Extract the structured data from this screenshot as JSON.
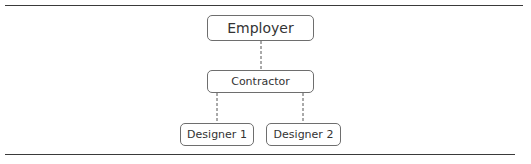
{
  "diagram": {
    "type": "org-chart",
    "nodes": [
      {
        "id": "employer",
        "label": "Employer"
      },
      {
        "id": "contractor",
        "label": "Contractor"
      },
      {
        "id": "designer1",
        "label": "Designer 1"
      },
      {
        "id": "designer2",
        "label": "Designer 2"
      }
    ],
    "edges": [
      {
        "from": "employer",
        "to": "contractor",
        "style": "dashed"
      },
      {
        "from": "contractor",
        "to": "designer1",
        "style": "dashed"
      },
      {
        "from": "contractor",
        "to": "designer2",
        "style": "dashed"
      }
    ],
    "colors": {
      "line": "#3a3a3a",
      "border": "#6e6e6e",
      "text": "#333333"
    }
  }
}
